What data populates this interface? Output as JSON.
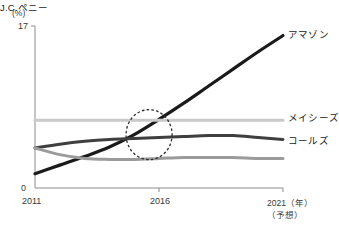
{
  "chart_data": {
    "type": "line",
    "title": "",
    "xlabel": "(年)",
    "ylabel": "(%)",
    "xlim": [
      2011,
      2021
    ],
    "ylim": [
      0,
      17
    ],
    "grid": false,
    "legend_position": "right-inline",
    "x": [
      2011,
      2012,
      2013,
      2014,
      2015,
      2016,
      2017,
      2018,
      2019,
      2020,
      2021
    ],
    "x_ticks": [
      "2011",
      "2016",
      "2021"
    ],
    "y_ticks": [
      "0",
      "17"
    ],
    "forecast_note": "(予想)",
    "annotations": [
      {
        "type": "dotted-circle",
        "label": "crossover-highlight",
        "center_x_year": 2015.6,
        "center_y_value": 5.6
      }
    ],
    "series": [
      {
        "name": "アマゾン",
        "color": "#1a1a1a",
        "width": 3.2,
        "values": [
          1.5,
          2.4,
          3.3,
          4.3,
          5.6,
          7.2,
          8.9,
          10.7,
          12.5,
          14.3,
          16.0
        ]
      },
      {
        "name": "メイシーズ",
        "color": "#c9c9c9",
        "width": 3.0,
        "values": [
          7.1,
          7.1,
          7.1,
          7.1,
          7.1,
          7.1,
          7.1,
          7.1,
          7.1,
          7.1,
          7.1
        ]
      },
      {
        "name": "コールズ",
        "color": "#3f3f3f",
        "width": 3.0,
        "values": [
          4.2,
          4.6,
          4.9,
          5.1,
          5.2,
          5.3,
          5.4,
          5.5,
          5.5,
          5.3,
          5.1
        ]
      },
      {
        "name": "J.C.ペニー",
        "color": "#9b9b9b",
        "width": 3.0,
        "values": [
          4.2,
          3.5,
          3.1,
          3.0,
          3.0,
          3.1,
          3.2,
          3.2,
          3.2,
          3.1,
          3.1
        ]
      }
    ]
  },
  "axes": {
    "y_unit": "(%)",
    "y_max": "17",
    "y_zero": "0",
    "x_first": "2011",
    "x_mid": "2016",
    "x_last": "2021（年）",
    "x_forecast": "（予想）"
  },
  "labels": {
    "amazon": "アマゾン",
    "macys": "メイシーズ",
    "kohls": "コールズ",
    "jcpenney": "J.C.ペニー"
  }
}
